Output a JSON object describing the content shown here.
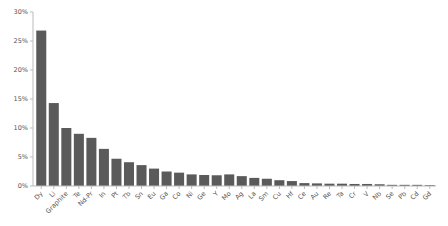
{
  "chart_data": {
    "type": "bar",
    "title": "",
    "xlabel": "",
    "ylabel": "",
    "ylim": [
      0,
      30
    ],
    "yticks": [
      "0%",
      "5%",
      "10%",
      "15%",
      "20%",
      "25%",
      "30%"
    ],
    "grid": false,
    "legend": null,
    "bar_color": "#5a5a5a",
    "categories": [
      "Dy",
      "Li",
      "Graphite",
      "Te",
      "Nd-Pr",
      "In",
      "Pt",
      "Tb",
      "Sn",
      "Eu",
      "Ga",
      "Co",
      "Ni",
      "Ge",
      "Y",
      "Mo",
      "Ag",
      "La",
      "Sm",
      "Cu",
      "Hf",
      "Ce",
      "Au",
      "Re",
      "Ta",
      "Cr",
      "V",
      "Nb",
      "Se",
      "Pb",
      "Cd",
      "Gd"
    ],
    "values": [
      26.8,
      14.3,
      10.0,
      9.0,
      8.3,
      6.4,
      4.7,
      4.1,
      3.6,
      3.0,
      2.5,
      2.3,
      2.0,
      1.9,
      1.85,
      2.0,
      1.7,
      1.4,
      1.25,
      1.0,
      0.85,
      0.5,
      0.45,
      0.4,
      0.4,
      0.35,
      0.35,
      0.3,
      0.2,
      0.2,
      0.2,
      0.15
    ]
  }
}
